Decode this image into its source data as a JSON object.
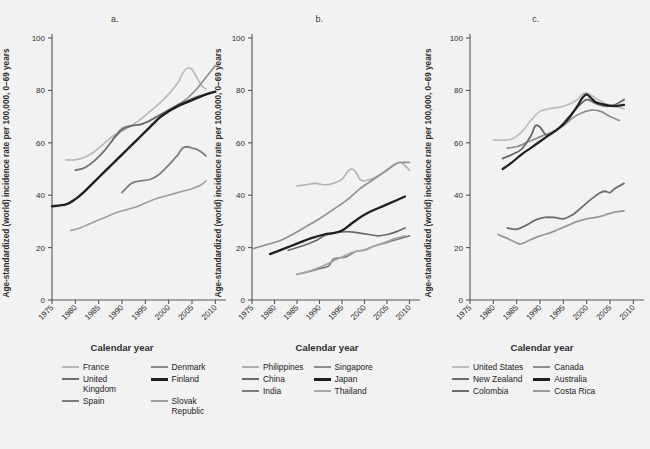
{
  "figure": {
    "background": "#f2f2f2",
    "axis_color": "#555555",
    "text_color": "#2e2e2e"
  },
  "common": {
    "ylabel": "Age-standardized (world) incidence rate per 100,000, 0–69 years",
    "xlabel": "Calendar year",
    "yticks": [
      "0",
      "20",
      "40",
      "60",
      "80",
      "100"
    ],
    "xticks": [
      "1975",
      "1980",
      "1985",
      "1990",
      "1995",
      "2000",
      "2005",
      "2010"
    ]
  },
  "panels": [
    {
      "label": "a."
    },
    {
      "label": "b."
    },
    {
      "label": "c."
    }
  ],
  "chart_data": [
    {
      "type": "line",
      "panel": "a.",
      "title": "a.",
      "xlabel": "Calendar year",
      "ylabel": "Age-standardized (world) incidence rate per 100,000, 0–69 years",
      "xlim": [
        1975,
        2011
      ],
      "ylim": [
        0,
        100
      ],
      "grid": false,
      "legend_position": "below",
      "series": [
        {
          "name": "France",
          "color": "#b8b8b8",
          "width": 1.6,
          "x": [
            1978,
            1980,
            1982,
            1984,
            1986,
            1988,
            1990,
            1992,
            1994,
            1996,
            1998,
            2000,
            2002,
            2003,
            2004,
            2005,
            2006,
            2007,
            2008
          ],
          "y": [
            53.5,
            53.5,
            54.5,
            56.5,
            59.5,
            62.5,
            64.5,
            66.5,
            69.0,
            72.0,
            75.0,
            78.5,
            83.0,
            86.5,
            88.5,
            88.0,
            85.0,
            82.0,
            80.5
          ]
        },
        {
          "name": "Denmark",
          "color": "#8c8c8c",
          "width": 1.6,
          "x": [
            1988,
            1990,
            1992,
            1994,
            1996,
            1998,
            2000,
            2002,
            2004,
            2006,
            2008,
            2010
          ],
          "y": [
            61.5,
            65.5,
            66.5,
            67.0,
            68.5,
            70.5,
            72.5,
            74.5,
            77.0,
            80.5,
            85.0,
            89.5
          ]
        },
        {
          "name": "United Kingdom",
          "color": "#6e6e6e",
          "width": 1.8,
          "x": [
            1980,
            1982,
            1984,
            1986,
            1988,
            1990,
            1992,
            1994,
            1996,
            1998,
            2000,
            2002,
            2004,
            2006,
            2008,
            2010
          ],
          "y": [
            49.5,
            50.5,
            53.0,
            56.5,
            61.0,
            65.0,
            66.5,
            67.0,
            68.5,
            70.5,
            72.5,
            74.5,
            76.0,
            77.5,
            78.5,
            79.5
          ]
        },
        {
          "name": "Finland",
          "color": "#1f1f1f",
          "width": 2.4,
          "x": [
            1975,
            1978,
            1980,
            1982,
            1984,
            1986,
            1988,
            1990,
            1992,
            1994,
            1996,
            1998,
            2000,
            2002,
            2004,
            2006,
            2008,
            2010
          ],
          "y": [
            35.8,
            36.5,
            38.5,
            41.5,
            45.0,
            48.5,
            52.0,
            55.5,
            59.0,
            62.5,
            66.0,
            69.5,
            72.0,
            74.0,
            75.5,
            77.0,
            78.5,
            79.5
          ]
        },
        {
          "name": "Spain",
          "color": "#7d7d7d",
          "width": 1.8,
          "x": [
            1990,
            1992,
            1994,
            1996,
            1998,
            2000,
            2001,
            2002,
            2003,
            2004,
            2005,
            2006,
            2007,
            2008
          ],
          "y": [
            41.0,
            44.5,
            45.5,
            46.0,
            48.0,
            51.5,
            53.5,
            55.5,
            58.0,
            58.5,
            58.0,
            57.5,
            56.5,
            55.0
          ]
        },
        {
          "name": "Slovak Republic",
          "color": "#9e9e9e",
          "width": 1.6,
          "x": [
            1979,
            1981,
            1983,
            1985,
            1987,
            1989,
            1991,
            1993,
            1995,
            1997,
            1999,
            2001,
            2003,
            2005,
            2007,
            2008
          ],
          "y": [
            26.5,
            27.5,
            29.0,
            30.5,
            32.0,
            33.5,
            34.5,
            35.5,
            37.0,
            38.5,
            39.5,
            40.5,
            41.5,
            42.5,
            44.0,
            45.5
          ]
        }
      ]
    },
    {
      "type": "line",
      "panel": "b.",
      "title": "b.",
      "xlabel": "Calendar year",
      "ylabel": "Age-standardized (world) incidence rate per 100,000, 0–69 years",
      "xlim": [
        1975,
        2011
      ],
      "ylim": [
        0,
        100
      ],
      "grid": false,
      "legend_position": "below",
      "series": [
        {
          "name": "Philippines",
          "color": "#b0b0b0",
          "width": 1.6,
          "x": [
            1985,
            1987,
            1989,
            1991,
            1993,
            1995,
            1996,
            1997,
            1998,
            1999,
            2000,
            2002,
            2004,
            2006,
            2008,
            2010
          ],
          "y": [
            43.5,
            44.0,
            44.5,
            44.0,
            44.5,
            46.0,
            48.5,
            50.0,
            49.0,
            46.0,
            45.5,
            46.5,
            48.5,
            51.0,
            52.5,
            49.5
          ]
        },
        {
          "name": "Singapore",
          "color": "#8f8f8f",
          "width": 1.6,
          "x": [
            1975,
            1978,
            1981,
            1984,
            1987,
            1990,
            1993,
            1996,
            1999,
            2002,
            2005,
            2007,
            2008,
            2010
          ],
          "y": [
            19.5,
            21.0,
            22.5,
            25.0,
            28.0,
            31.0,
            34.5,
            38.0,
            42.5,
            46.0,
            49.5,
            52.0,
            52.5,
            52.5
          ]
        },
        {
          "name": "China",
          "color": "#6b6b6b",
          "width": 1.7,
          "x": [
            1983,
            1986,
            1989,
            1991,
            1993,
            1995,
            1997,
            1999,
            2001,
            2003,
            2005,
            2007,
            2009
          ],
          "y": [
            19.0,
            20.5,
            22.5,
            24.5,
            25.5,
            26.0,
            26.0,
            25.5,
            25.0,
            24.5,
            25.0,
            26.0,
            27.5
          ]
        },
        {
          "name": "Japan",
          "color": "#1f1f1f",
          "width": 2.3,
          "x": [
            1979,
            1982,
            1985,
            1988,
            1991,
            1993,
            1995,
            1997,
            1999,
            2001,
            2003,
            2005,
            2007,
            2009
          ],
          "y": [
            17.5,
            19.5,
            21.5,
            23.5,
            25.0,
            25.5,
            26.5,
            29.0,
            31.5,
            33.5,
            35.0,
            36.5,
            38.0,
            39.5
          ]
        },
        {
          "name": "India",
          "color": "#7d7d7d",
          "width": 1.7,
          "x": [
            1985,
            1988,
            1990,
            1992,
            1993,
            1994,
            1996,
            1998,
            2000,
            2002,
            2004,
            2006,
            2008,
            2010
          ],
          "y": [
            9.8,
            11.0,
            12.0,
            13.0,
            15.5,
            16.0,
            16.5,
            18.5,
            19.0,
            20.5,
            21.5,
            22.5,
            23.5,
            24.5
          ]
        },
        {
          "name": "Thailand",
          "color": "#a8a8a8",
          "width": 1.6,
          "x": [
            1985,
            1988,
            1991,
            1994,
            1997,
            2000,
            2003,
            2006,
            2009
          ],
          "y": [
            9.8,
            11.2,
            13.2,
            15.6,
            18.0,
            19.2,
            21.0,
            23.0,
            24.5
          ]
        }
      ]
    },
    {
      "type": "line",
      "panel": "c.",
      "title": "c.",
      "xlabel": "Calendar year",
      "ylabel": "Age-standardized (world) incidence rate per 100,000, 0–69 years",
      "xlim": [
        1975,
        2011
      ],
      "ylim": [
        0,
        100
      ],
      "grid": false,
      "legend_position": "below",
      "series": [
        {
          "name": "United States",
          "color": "#bdbdbd",
          "width": 1.7,
          "x": [
            1980,
            1982,
            1984,
            1986,
            1988,
            1990,
            1992,
            1994,
            1996,
            1998,
            1999,
            2000,
            2002,
            2004,
            2006,
            2008
          ],
          "y": [
            61.0,
            61.0,
            61.5,
            64.0,
            68.5,
            72.0,
            73.0,
            73.5,
            74.5,
            76.5,
            78.5,
            79.0,
            77.0,
            75.0,
            74.0,
            73.0
          ]
        },
        {
          "name": "Canada",
          "color": "#8f8f8f",
          "width": 1.7,
          "x": [
            1983,
            1985,
            1987,
            1989,
            1991,
            1993,
            1995,
            1997,
            1999,
            2001,
            2003,
            2005,
            2007
          ],
          "y": [
            58.0,
            58.5,
            60.0,
            61.5,
            63.0,
            64.5,
            66.5,
            69.5,
            71.5,
            72.5,
            72.0,
            70.0,
            68.5
          ]
        },
        {
          "name": "New Zealand",
          "color": "#6b6b6b",
          "width": 1.9,
          "x": [
            1982,
            1984,
            1986,
            1988,
            1989,
            1990,
            1991,
            1992,
            1994,
            1996,
            1998,
            2000,
            2002,
            2004,
            2006,
            2008
          ],
          "y": [
            54.0,
            55.5,
            57.5,
            62.5,
            66.5,
            66.0,
            63.5,
            63.0,
            65.5,
            69.5,
            73.5,
            76.5,
            75.0,
            74.0,
            74.5,
            76.5
          ]
        },
        {
          "name": "Australia",
          "color": "#1f1f1f",
          "width": 2.2,
          "x": [
            1982,
            1984,
            1986,
            1988,
            1990,
            1992,
            1994,
            1996,
            1998,
            1999,
            2000,
            2001,
            2002,
            2004,
            2006,
            2008
          ],
          "y": [
            50.0,
            52.5,
            55.5,
            58.0,
            60.5,
            63.0,
            65.5,
            69.0,
            74.0,
            77.0,
            78.5,
            77.0,
            75.5,
            74.5,
            74.0,
            74.5
          ]
        },
        {
          "name": "Colombia",
          "color": "#6e6e6e",
          "width": 1.8,
          "x": [
            1983,
            1985,
            1987,
            1989,
            1991,
            1993,
            1995,
            1997,
            1999,
            2001,
            2003,
            2004,
            2005,
            2006,
            2008
          ],
          "y": [
            27.5,
            27.0,
            28.5,
            30.5,
            31.5,
            31.5,
            31.0,
            32.5,
            35.5,
            38.5,
            41.0,
            41.5,
            41.0,
            42.5,
            44.5
          ]
        },
        {
          "name": "Costa Rica",
          "color": "#9a9a9a",
          "width": 1.8,
          "x": [
            1981,
            1983,
            1985,
            1986,
            1988,
            1990,
            1992,
            1994,
            1996,
            1998,
            2000,
            2002,
            2004,
            2006,
            2008
          ],
          "y": [
            25.0,
            23.5,
            21.8,
            21.5,
            23.0,
            24.5,
            25.5,
            27.0,
            28.5,
            30.0,
            31.0,
            31.5,
            32.5,
            33.5,
            34.0
          ]
        }
      ]
    }
  ],
  "legends": [
    {
      "panel": "a.",
      "items": [
        {
          "label": "France",
          "color": "#b8b8b8",
          "weight": "thin"
        },
        {
          "label": "Denmark",
          "color": "#8c8c8c",
          "weight": "thin"
        },
        {
          "label": "United Kingdom",
          "color": "#6e6e6e",
          "weight": "medium"
        },
        {
          "label": "Finland",
          "color": "#1f1f1f",
          "weight": "thick"
        },
        {
          "label": "Spain",
          "color": "#7d7d7d",
          "weight": "medium"
        },
        {
          "label": "Slovak Republic",
          "color": "#9e9e9e",
          "weight": "thin"
        }
      ]
    },
    {
      "panel": "b.",
      "items": [
        {
          "label": "Philippines",
          "color": "#b0b0b0",
          "weight": "thin"
        },
        {
          "label": "Singapore",
          "color": "#8f8f8f",
          "weight": "thin"
        },
        {
          "label": "China",
          "color": "#6b6b6b",
          "weight": "medium"
        },
        {
          "label": "Japan",
          "color": "#1f1f1f",
          "weight": "thick"
        },
        {
          "label": "India",
          "color": "#7d7d7d",
          "weight": "medium"
        },
        {
          "label": "Thailand",
          "color": "#a8a8a8",
          "weight": "thin"
        }
      ]
    },
    {
      "panel": "c.",
      "items": [
        {
          "label": "United States",
          "color": "#bdbdbd",
          "weight": "thin"
        },
        {
          "label": "Canada",
          "color": "#8f8f8f",
          "weight": "thin"
        },
        {
          "label": "New Zealand",
          "color": "#6b6b6b",
          "weight": "medium"
        },
        {
          "label": "Australia",
          "color": "#1f1f1f",
          "weight": "thick"
        },
        {
          "label": "Colombia",
          "color": "#6e6e6e",
          "weight": "medium"
        },
        {
          "label": "Costa Rica",
          "color": "#9a9a9a",
          "weight": "thin"
        }
      ]
    }
  ]
}
